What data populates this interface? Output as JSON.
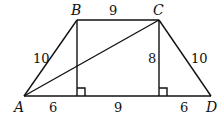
{
  "diagram": {
    "type": "trapezoid",
    "points": {
      "A": {
        "label": "A",
        "x": 24,
        "y": 96
      },
      "B": {
        "label": "B",
        "x": 77,
        "y": 20
      },
      "C": {
        "label": "C",
        "x": 159,
        "y": 20
      },
      "D": {
        "label": "D",
        "x": 211,
        "y": 96
      }
    },
    "lengths": {
      "AB": "10",
      "BC": "9",
      "CD": "10",
      "height": "8",
      "bottom_left": "6",
      "bottom_middle": "9",
      "bottom_right": "6"
    },
    "stroke_color": "#111111"
  }
}
